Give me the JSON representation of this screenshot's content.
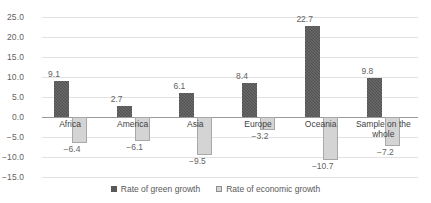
{
  "chart_data": {
    "type": "bar",
    "title": "",
    "xlabel": "",
    "ylabel": "",
    "ylim": [
      -15.0,
      25.0
    ],
    "yticks": [
      "25.0",
      "20.0",
      "15.0",
      "10.0",
      "5.0",
      "0.0",
      "-5.0",
      "-10.0",
      "-15.0"
    ],
    "ytick_values": [
      25.0,
      20.0,
      15.0,
      10.0,
      5.0,
      0.0,
      -5.0,
      -10.0,
      -15.0
    ],
    "grid": true,
    "legend_position": "bottom-center",
    "categories": [
      "Africa",
      "America",
      "Asia",
      "Europe",
      "Oceania",
      "Sample on the whole"
    ],
    "series": [
      {
        "name": "Rate of green growth",
        "color": "#595959",
        "values": [
          9.1,
          2.7,
          6.1,
          8.4,
          22.7,
          9.8
        ],
        "labels": [
          "9.1",
          "2.7",
          "6.1",
          "8.4",
          "22.7",
          "9.8"
        ]
      },
      {
        "name": "Rate of economic growth",
        "color": "#d4d4d4",
        "values": [
          -6.4,
          -6.1,
          -9.5,
          -3.2,
          -10.7,
          -7.2
        ],
        "labels": [
          "−6.4",
          "−6.1",
          "−9.5",
          "−3.2",
          "−10.7",
          "−7.2"
        ]
      }
    ]
  },
  "legend": {
    "items": [
      {
        "label": "Rate of green growth"
      },
      {
        "label": "Rate of economic growth"
      }
    ]
  },
  "colors": {
    "green_growth": "#595959",
    "economic_growth": "#d4d4d4",
    "gridline": "#e2e2e2",
    "axis": "#9a9a9a",
    "text": "#595959"
  }
}
